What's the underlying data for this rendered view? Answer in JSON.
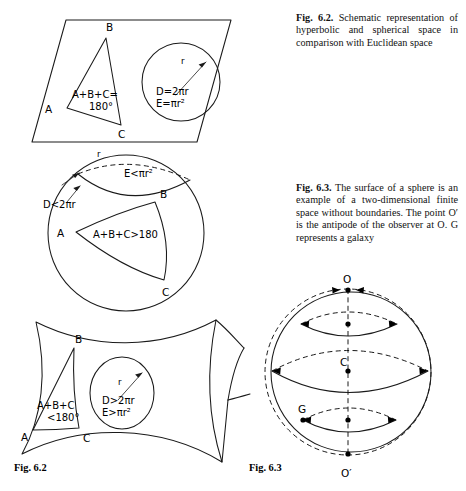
{
  "page": {
    "width": 466,
    "height": 491,
    "background": "#ffffff",
    "ink_color": "#1a1a1a"
  },
  "captions": {
    "fig62": {
      "lead": "Fig. 6.2.",
      "text": " Schematic representation of hyperbolic and spherical space in comparison with Euclidean space"
    },
    "fig63": {
      "lead": "Fig. 6.3.",
      "text": " The surface of a sphere is an example of a two-dimensional finite space without boundaries. The point O′ is the antipode of the observer at O. G represents a galaxy"
    }
  },
  "fignums": {
    "fig62": "Fig. 6.2",
    "fig63": "Fig. 6.3"
  },
  "panels": {
    "euclidean": {
      "name": "Euclidean plane",
      "triangle": {
        "vertex_a": "A",
        "vertex_b": "B",
        "vertex_c": "C",
        "sum_line1": "A+B+C=",
        "sum_line2": "180°"
      },
      "circle": {
        "radius_label": "r",
        "circumference": "D=2πr",
        "area": "E=πr²"
      }
    },
    "spherical": {
      "name": "Spherical (positively curved) space",
      "triangle": {
        "vertex_a": "A",
        "vertex_b": "B",
        "vertex_c": "C",
        "sum": "A+B+C>180"
      },
      "circle": {
        "radius_label": "r",
        "circumference": "D<2πr",
        "area": "E<πr²"
      }
    },
    "hyperbolic": {
      "name": "Hyperbolic (negatively curved) space",
      "triangle": {
        "vertex_a": "A",
        "vertex_b": "B",
        "vertex_c": "C",
        "sum_line1": "A+B+C",
        "sum_line2": "<180°"
      },
      "circle": {
        "radius_label": "r",
        "circumference": "D>2πr",
        "area": "E>πr²"
      }
    },
    "sphere_surface": {
      "name": "Sphere surface with observer and antipode",
      "observer": "O",
      "antipode": "O′",
      "center": "C",
      "galaxy": "G"
    }
  }
}
